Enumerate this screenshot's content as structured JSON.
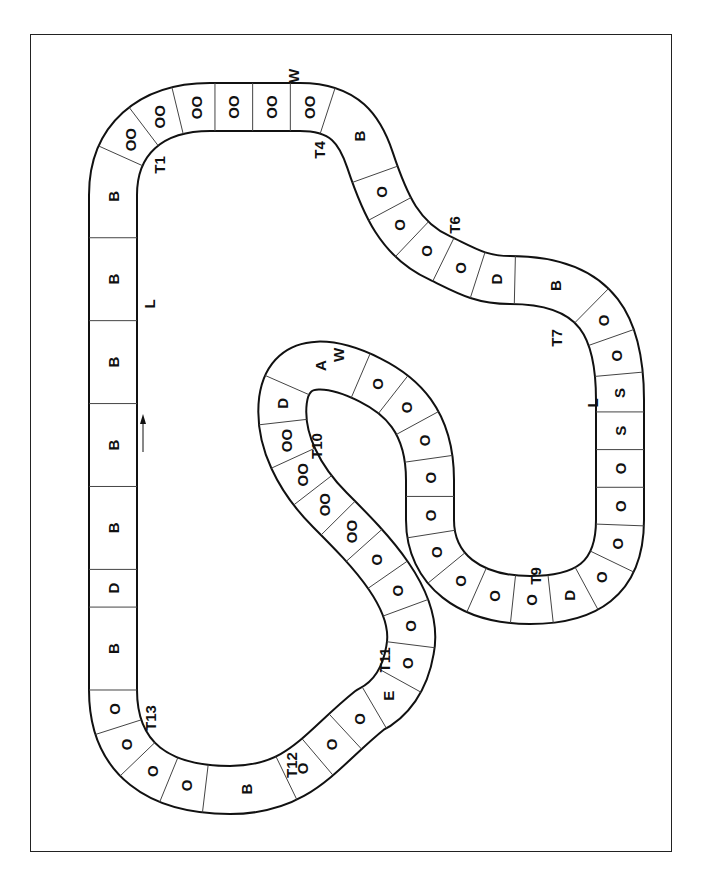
{
  "diagram": {
    "colors": {
      "line": "#111111",
      "background": "#ffffff"
    },
    "direction_arrow": "arrow-up-icon",
    "turn_labels": [
      "T1",
      "T4",
      "T6",
      "T7",
      "T9",
      "T10",
      "T11",
      "T12",
      "T13"
    ],
    "markers": [
      "W",
      "L",
      "L",
      "W"
    ],
    "segments": [
      "B",
      "D",
      "B",
      "B",
      "B",
      "B",
      "B",
      "OO",
      "OO",
      "OO",
      "OO",
      "OO",
      "OO",
      "B",
      "O",
      "O",
      "O",
      "O",
      "D",
      "B",
      "O",
      "O",
      "S",
      "S",
      "O",
      "O",
      "O",
      "O",
      "D",
      "O",
      "O",
      "O",
      "O",
      "O",
      "O",
      "O",
      "O",
      "O",
      "A",
      "D",
      "OO",
      "OO",
      "OO",
      "OO",
      "O",
      "O",
      "O",
      "O",
      "E",
      "O",
      "O",
      "O",
      "B",
      "O",
      "O",
      "O",
      "O"
    ]
  }
}
